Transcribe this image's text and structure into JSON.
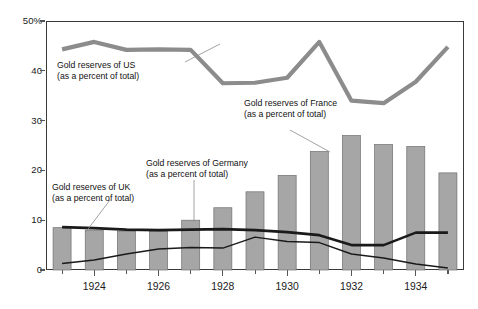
{
  "chart": {
    "type": "combo",
    "y_axis": {
      "ticks": [
        "50%",
        "40",
        "30",
        "20",
        "10",
        "0"
      ],
      "tick_values": [
        50,
        40,
        30,
        20,
        10,
        0
      ],
      "min": 0,
      "max": 50,
      "label": "",
      "grid": false
    },
    "x_axis": {
      "tick_labels": [
        "1924",
        "1926",
        "1928",
        "1930",
        "1932",
        "1934"
      ],
      "tick_label_years": [
        1924,
        1926,
        1928,
        1930,
        1932,
        1934
      ],
      "label": "",
      "years": [
        1923,
        1924,
        1925,
        1926,
        1927,
        1928,
        1929,
        1930,
        1931,
        1932,
        1933,
        1934,
        1935
      ]
    },
    "annotations": [
      {
        "name": "us-annotation",
        "line1": "Gold reserves of US",
        "line2": "(as a percent of total)",
        "x": 57,
        "y": 60
      },
      {
        "name": "france-annotation",
        "line1": "Gold reserves of France",
        "line2": "(as a percent of total)",
        "x": 244,
        "y": 98
      },
      {
        "name": "germany-annotation",
        "line1": "Gold reserves of Germany",
        "line2": "(as a percent of total)",
        "x": 146,
        "y": 158
      },
      {
        "name": "uk-annotation",
        "line1": "Gold reserves of UK",
        "line2": "(as a percent of total)",
        "x": 52,
        "y": 182
      }
    ]
  },
  "chart_data": {
    "type": "bar",
    "title": "",
    "xlabel": "",
    "ylabel": "",
    "ylim": [
      0,
      50
    ],
    "grid": false,
    "legend": "annotations-inline",
    "categories": [
      1923,
      1924,
      1925,
      1926,
      1927,
      1928,
      1929,
      1930,
      1931,
      1932,
      1933,
      1934,
      1935
    ],
    "tick_labels": [
      "1924",
      "1926",
      "1928",
      "1930",
      "1932",
      "1934"
    ],
    "series": [
      {
        "name": "Gold reserves of France (as a percent of total)",
        "render": "bar",
        "color": "#a6a6a6",
        "values": [
          8.5,
          8.0,
          7.8,
          7.8,
          10.0,
          12.5,
          15.7,
          19.0,
          23.8,
          27.0,
          25.2,
          24.8,
          19.5
        ]
      },
      {
        "name": "Gold reserves of US (as a percent of total)",
        "render": "line",
        "color": "#8c8c8c",
        "width": 4.2,
        "values": [
          44.3,
          45.8,
          44.2,
          44.3,
          44.2,
          37.5,
          37.6,
          38.6,
          45.8,
          34.0,
          33.5,
          37.8,
          44.8
        ]
      },
      {
        "name": "Gold reserves of UK (as a percent of total)",
        "render": "line",
        "color": "#1a1a1a",
        "width": 2.6,
        "values": [
          8.6,
          8.4,
          8.1,
          8.0,
          8.1,
          8.2,
          8.0,
          7.6,
          7.0,
          5.0,
          5.0,
          7.5,
          7.5
        ]
      },
      {
        "name": "Gold reserves of Germany (as a percent of total)",
        "render": "line",
        "color": "#1a1a1a",
        "width": 1.5,
        "values": [
          1.3,
          2.0,
          3.2,
          4.2,
          4.5,
          4.4,
          6.6,
          5.7,
          5.5,
          3.2,
          2.4,
          1.2,
          0.4
        ]
      }
    ]
  }
}
